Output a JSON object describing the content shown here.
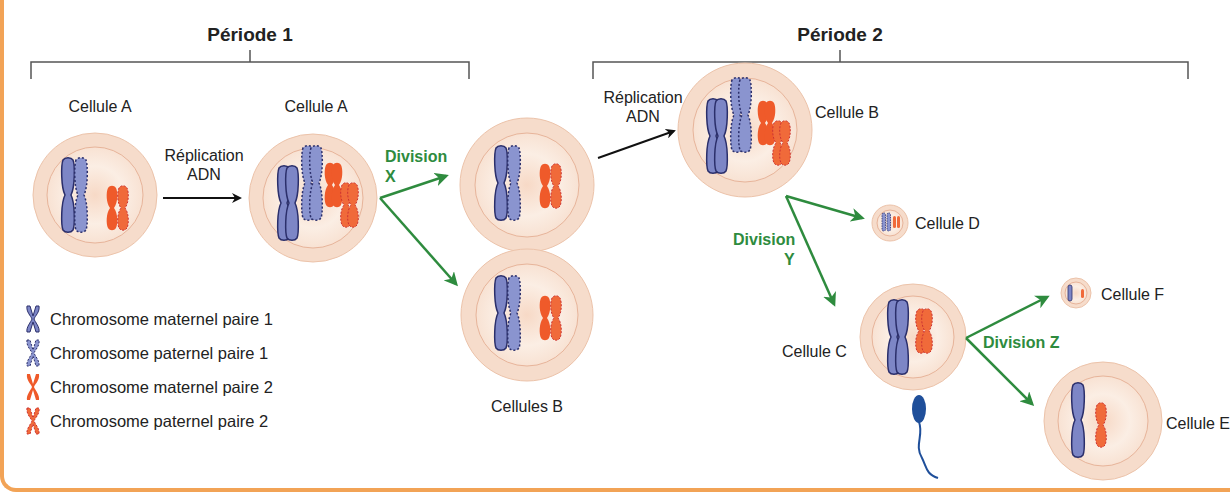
{
  "colors": {
    "frame": "#f2a356",
    "cell_outer": "#f6dccb",
    "cell_inner": "#fbece1",
    "cell_ring": "#e7b49a",
    "maternal_1": "#7d86c6",
    "paternal_1": "#8a94cf",
    "maternal_2": "#ef5a2a",
    "paternal_2": "#f06a3a",
    "outline_1": "#2b2f6b",
    "arrow_black": "#111111",
    "arrow_green": "#2e8b3e",
    "sperm": "#1f4f9a"
  },
  "periods": [
    {
      "label": "Période 1"
    },
    {
      "label": "Période 2"
    }
  ],
  "cells": {
    "a1": {
      "label": "Cellule A"
    },
    "a2": {
      "label": "Cellule A"
    },
    "b_top": {
      "label": ""
    },
    "b_bottom": {
      "label": "Cellules B"
    },
    "b": {
      "label": "Cellule B"
    },
    "c": {
      "label": "Cellule C"
    },
    "d": {
      "label": "Cellule D"
    },
    "e": {
      "label": "Cellule E"
    },
    "f": {
      "label": "Cellule F"
    }
  },
  "arrows": {
    "replication_1": {
      "line1": "Réplication",
      "line2": "ADN"
    },
    "replication_2": {
      "line1": "Réplication",
      "line2": "ADN"
    },
    "division_x": {
      "line1": "Division",
      "line2": "X"
    },
    "division_y": {
      "line1": "Division",
      "line2": "Y"
    },
    "division_z": {
      "line1": "Division Z"
    }
  },
  "legend": [
    {
      "label": "Chromosome maternel paire 1",
      "icon": "maternal-chromosome-pair-1-icon"
    },
    {
      "label": "Chromosome paternel paire 1",
      "icon": "paternal-chromosome-pair-1-icon"
    },
    {
      "label": "Chromosome maternel paire 2",
      "icon": "maternal-chromosome-pair-2-icon"
    },
    {
      "label": "Chromosome paternel paire 2",
      "icon": "paternal-chromosome-pair-2-icon"
    }
  ]
}
